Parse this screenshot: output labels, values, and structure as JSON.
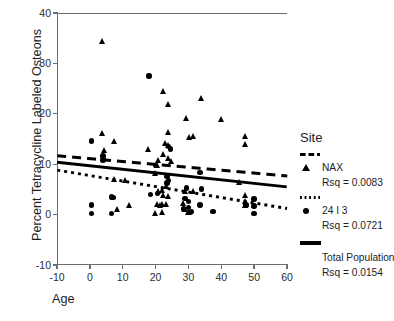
{
  "chart_data": {
    "type": "scatter",
    "title": "",
    "xlabel": "Age",
    "ylabel": "Percent Tetracycline Labeled Osteons",
    "xlim": [
      -10,
      60
    ],
    "ylim": [
      -10,
      40
    ],
    "xticks": [
      -10,
      0,
      10,
      20,
      30,
      40,
      50,
      60
    ],
    "yticks": [
      -10,
      0,
      10,
      20,
      30,
      40
    ],
    "grid": false,
    "legend_position": "right",
    "legend_title": "Site",
    "series": [
      {
        "name": "NAX",
        "marker": "triangle",
        "color": "#000000",
        "fit_line": "dashed",
        "rsq_label": "Rsq = 0.0083",
        "rsq": 0.0083,
        "fit_endpoints": [
          [
            -10,
            11.6
          ],
          [
            60,
            7.6
          ]
        ],
        "points": [
          [
            4,
            34.3
          ],
          [
            22.5,
            24.4
          ],
          [
            24,
            21.9
          ],
          [
            34,
            23.1
          ],
          [
            29.5,
            19.0
          ],
          [
            40,
            18.9
          ],
          [
            4,
            16.1
          ],
          [
            24,
            16.4
          ],
          [
            47.5,
            15.6
          ],
          [
            30.5,
            15.3
          ],
          [
            31.5,
            15.5
          ],
          [
            7.5,
            14.6
          ],
          [
            47.5,
            14.0
          ],
          [
            18,
            12.9
          ],
          [
            24,
            13.7
          ],
          [
            23,
            14.2
          ],
          [
            4.5,
            12.7
          ],
          [
            22.5,
            12.0
          ],
          [
            21,
            10.8
          ],
          [
            24,
            11.2
          ],
          [
            25,
            10.5
          ],
          [
            20.5,
            9.7
          ],
          [
            20,
            8.2
          ],
          [
            7.5,
            6.9
          ],
          [
            11,
            6.8
          ],
          [
            45.5,
            6.4
          ],
          [
            23.5,
            5.5
          ],
          [
            22,
            4.8
          ],
          [
            21,
            4.6
          ],
          [
            29,
            4.7
          ],
          [
            31.5,
            4.6
          ],
          [
            22.5,
            3.9
          ],
          [
            24,
            3.6
          ],
          [
            12,
            1.9
          ],
          [
            8.5,
            1.1
          ],
          [
            20.5,
            2.0
          ],
          [
            22,
            2.1
          ],
          [
            23.5,
            2.1
          ],
          [
            21.5,
            1.8
          ],
          [
            28.5,
            2.2
          ],
          [
            29,
            1.0
          ],
          [
            30,
            0.5
          ],
          [
            20,
            0.2
          ],
          [
            22,
            0.4
          ],
          [
            47.5,
            3.9
          ],
          [
            47.5,
            2.6
          ],
          [
            47.5,
            1.9
          ]
        ]
      },
      {
        "name": "24 I 3",
        "marker": "circle",
        "color": "#000000",
        "fit_line": "dotted",
        "rsq_label": "Rsq = 0.0721",
        "rsq": 0.0721,
        "fit_endpoints": [
          [
            -10,
            8.9
          ],
          [
            60,
            1.3
          ]
        ],
        "points": [
          [
            18,
            27.5
          ],
          [
            0.5,
            14.6
          ],
          [
            4,
            11.6
          ],
          [
            4,
            10.8
          ],
          [
            24,
            13.5
          ],
          [
            24.5,
            13.0
          ],
          [
            20,
            9.8
          ],
          [
            23.5,
            7.6
          ],
          [
            24,
            6.8
          ],
          [
            23.5,
            6.3
          ],
          [
            33.5,
            8.3
          ],
          [
            29.5,
            5.3
          ],
          [
            34,
            5.1
          ],
          [
            18.5,
            4.0
          ],
          [
            20.5,
            4.2
          ],
          [
            6.5,
            3.5
          ],
          [
            7,
            3.4
          ],
          [
            29,
            3.2
          ],
          [
            30,
            2.6
          ],
          [
            33.5,
            1.9
          ],
          [
            37.5,
            0.6
          ],
          [
            28.5,
            1.1
          ],
          [
            30,
            1.4
          ],
          [
            31,
            0.6
          ],
          [
            0.5,
            1.9
          ],
          [
            0.5,
            0.2
          ],
          [
            6.5,
            0.2
          ],
          [
            50,
            3.1
          ],
          [
            50,
            1.7
          ],
          [
            50,
            0.2
          ],
          [
            47.5,
            1.9
          ],
          [
            30.5,
            0.4
          ]
        ]
      },
      {
        "name": "Total Population",
        "marker": "none",
        "color": "#000000",
        "fit_line": "solid",
        "rsq_label": "Rsq = 0.0154",
        "rsq": 0.0154,
        "fit_endpoints": [
          [
            -10,
            10.5
          ],
          [
            60,
            5.6
          ]
        ],
        "points": []
      }
    ]
  },
  "axes": {
    "y_title": "Percent Tetracycline Labeled Osteons",
    "x_title": "Age",
    "y_ticks": [
      "40",
      "30",
      "20",
      "10",
      "0",
      "-10"
    ],
    "x_ticks": [
      "-10",
      "0",
      "10",
      "20",
      "30",
      "40",
      "50",
      "60"
    ]
  },
  "legend": {
    "title": "Site",
    "entries": [
      {
        "label": "NAX",
        "rsq": "Rsq = 0.0083"
      },
      {
        "label": "24 I 3",
        "rsq": "Rsq = 0.0721"
      },
      {
        "label": "Total Population",
        "rsq": "Rsq = 0.0154"
      }
    ]
  }
}
